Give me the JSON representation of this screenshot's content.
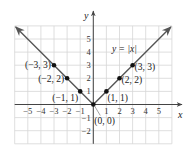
{
  "chart_data": {
    "type": "line",
    "title": "",
    "function_label": "y = |x|",
    "xlabel": "x",
    "ylabel": "y",
    "xlim": [
      -6,
      6
    ],
    "ylim": [
      -3,
      6
    ],
    "grid": true,
    "x_ticks": [
      -5,
      -4,
      -3,
      -2,
      -1,
      1,
      2,
      3,
      4,
      5
    ],
    "y_ticks": [
      -2,
      -1,
      1,
      2,
      3,
      4,
      5
    ],
    "x_tick_labels": [
      "−5",
      "−4",
      "−3",
      "−2",
      "−1",
      "1",
      "2",
      "3",
      "4",
      "5"
    ],
    "y_tick_labels": [
      "−2",
      "−1",
      "1",
      "2",
      "3",
      "4",
      "5"
    ],
    "series": [
      {
        "name": "y = |x|",
        "x": [
          -6,
          -5,
          -4,
          -3,
          -2,
          -1,
          0,
          1,
          2,
          3,
          4,
          5,
          6
        ],
        "y": [
          6,
          5,
          4,
          3,
          2,
          1,
          0,
          1,
          2,
          3,
          4,
          5,
          6
        ]
      }
    ],
    "points": [
      {
        "x": -3,
        "y": 3,
        "label": "(−3, 3)"
      },
      {
        "x": -2,
        "y": 2,
        "label": "(−2, 2)"
      },
      {
        "x": -1,
        "y": 1,
        "label": "(−1, 1)"
      },
      {
        "x": 0,
        "y": 0,
        "label": "(0, 0)"
      },
      {
        "x": 1,
        "y": 1,
        "label": "(1, 1)"
      },
      {
        "x": 2,
        "y": 2,
        "label": "(2, 2)"
      },
      {
        "x": 3,
        "y": 3,
        "label": "(3, 3)"
      }
    ],
    "colors": {
      "line": "#555555",
      "grid": "#d6d6d6",
      "axis": "#444444",
      "point": "#111111"
    }
  }
}
